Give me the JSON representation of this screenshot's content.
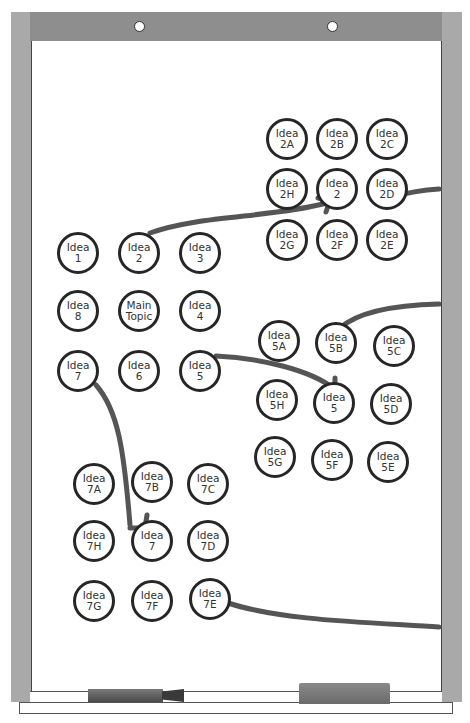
{
  "diagram": {
    "type": "lotus-blossom-mind-map-on-whiteboard",
    "colors": {
      "frame": "#a9a9a9",
      "frame_top": "#8e8e8e",
      "board": "#ffffff",
      "ink": "#262626",
      "arrow": "#555555"
    },
    "center_grid": {
      "nodes": [
        {
          "id": "i1",
          "l1": "Idea",
          "l2": "1"
        },
        {
          "id": "i2",
          "l1": "Idea",
          "l2": "2"
        },
        {
          "id": "i3",
          "l1": "Idea",
          "l2": "3"
        },
        {
          "id": "i8",
          "l1": "Idea",
          "l2": "8"
        },
        {
          "id": "main",
          "l1": "Main",
          "l2": "Topic"
        },
        {
          "id": "i4",
          "l1": "Idea",
          "l2": "4"
        },
        {
          "id": "i7",
          "l1": "Idea",
          "l2": "7"
        },
        {
          "id": "i6",
          "l1": "Idea",
          "l2": "6"
        },
        {
          "id": "i5",
          "l1": "Idea",
          "l2": "5"
        }
      ]
    },
    "grid_2": {
      "nodes": [
        {
          "id": "2A",
          "l1": "Idea",
          "l2": "2A"
        },
        {
          "id": "2B",
          "l1": "Idea",
          "l2": "2B"
        },
        {
          "id": "2C",
          "l1": "Idea",
          "l2": "2C"
        },
        {
          "id": "2H",
          "l1": "Idea",
          "l2": "2H"
        },
        {
          "id": "2",
          "l1": "Idea",
          "l2": "2"
        },
        {
          "id": "2D",
          "l1": "Idea",
          "l2": "2D"
        },
        {
          "id": "2G",
          "l1": "Idea",
          "l2": "2G"
        },
        {
          "id": "2F",
          "l1": "Idea",
          "l2": "2F"
        },
        {
          "id": "2E",
          "l1": "Idea",
          "l2": "2E"
        }
      ]
    },
    "grid_5": {
      "nodes": [
        {
          "id": "5A",
          "l1": "Idea",
          "l2": "5A"
        },
        {
          "id": "5B",
          "l1": "Idea",
          "l2": "5B"
        },
        {
          "id": "5C",
          "l1": "Idea",
          "l2": "5C"
        },
        {
          "id": "5H",
          "l1": "Idea",
          "l2": "5H"
        },
        {
          "id": "5",
          "l1": "Idea",
          "l2": "5"
        },
        {
          "id": "5D",
          "l1": "Idea",
          "l2": "5D"
        },
        {
          "id": "5G",
          "l1": "Idea",
          "l2": "5G"
        },
        {
          "id": "5F",
          "l1": "Idea",
          "l2": "5F"
        },
        {
          "id": "5E",
          "l1": "Idea",
          "l2": "5E"
        }
      ]
    },
    "grid_7": {
      "nodes": [
        {
          "id": "7A",
          "l1": "Idea",
          "l2": "7A"
        },
        {
          "id": "7B",
          "l1": "Idea",
          "l2": "7B"
        },
        {
          "id": "7C",
          "l1": "Idea",
          "l2": "7C"
        },
        {
          "id": "7H",
          "l1": "Idea",
          "l2": "7H"
        },
        {
          "id": "7",
          "l1": "Idea",
          "l2": "7"
        },
        {
          "id": "7D",
          "l1": "Idea",
          "l2": "7D"
        },
        {
          "id": "7G",
          "l1": "Idea",
          "l2": "7G"
        },
        {
          "id": "7F",
          "l1": "Idea",
          "l2": "7F"
        },
        {
          "id": "7E",
          "l1": "Idea",
          "l2": "7E"
        }
      ]
    },
    "connections": [
      {
        "from": "Idea 2",
        "to": "Idea 2 (grid 2 center)"
      },
      {
        "from": "Idea 5",
        "to": "Idea 5 (grid 5 center)"
      },
      {
        "from": "Idea 7",
        "to": "Idea 7 (grid 7 center)"
      },
      {
        "from": "Idea 2D",
        "to": "off-board right"
      },
      {
        "from": "off-board right",
        "to": "Idea 5B"
      },
      {
        "from": "Idea 7E",
        "to": "off-board right"
      }
    ]
  }
}
